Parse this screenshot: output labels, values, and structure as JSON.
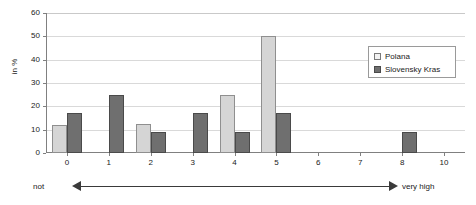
{
  "chart_data": {
    "type": "bar",
    "title": "",
    "subtitle": "",
    "xlabel": "",
    "ylabel": "in %",
    "ylim": [
      0,
      60
    ],
    "yticks": [
      "0",
      "10",
      "20",
      "30",
      "40",
      "50",
      "60"
    ],
    "grid": true,
    "legend_position": "top-right",
    "categories": [
      "0",
      "1",
      "2",
      "3",
      "4",
      "5",
      "6",
      "7",
      "8",
      "10"
    ],
    "series": [
      {
        "name": "Polana",
        "color": "#d5d5d5",
        "values": [
          12,
          0,
          12.5,
          0,
          25,
          50,
          0,
          0,
          0,
          0
        ]
      },
      {
        "name": "Slovensky Kras",
        "color": "#6f6f6f",
        "values": [
          17,
          25,
          9,
          17,
          9,
          17,
          0,
          0,
          9,
          0
        ]
      }
    ],
    "scale_annotation": {
      "left_label": "not",
      "right_label": "very high",
      "arrow": "double-headed"
    }
  },
  "legend": {
    "items": [
      {
        "label": "Polana",
        "swatch": "polana-swatch"
      },
      {
        "label": "Slovensky Kras",
        "swatch": "kras-swatch"
      }
    ]
  },
  "axes": {
    "y_title": "in %"
  }
}
